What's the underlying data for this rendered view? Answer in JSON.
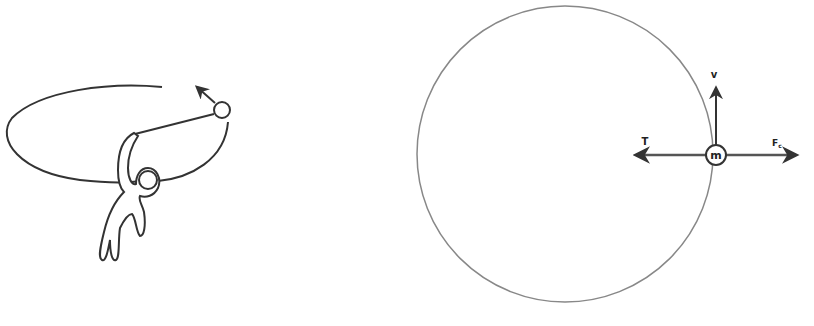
{
  "caption_cut": "",
  "left_figure": {
    "description": "person swinging a ball on a string in a horizontal circle",
    "velocity_arrow": "tangential"
  },
  "right_figure": {
    "mass_label": "m",
    "velocity_label": "v",
    "tension_label": "T",
    "force_label": "F",
    "force_subscript": "c"
  },
  "colors": {
    "stroke": "#333333",
    "circle": "#888888",
    "background": "#ffffff"
  }
}
